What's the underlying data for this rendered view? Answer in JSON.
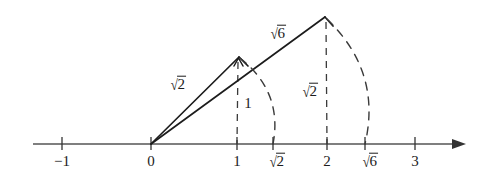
{
  "figure": {
    "background_color": "#ffffff",
    "ink_color": "#1c1c1c",
    "axis": {
      "name": "number-line",
      "y": 144,
      "x_start": 33,
      "x_end": 465,
      "arrow": "right",
      "tick_height": 9
    },
    "ticks": [
      {
        "label": "-1",
        "display": "−1",
        "kind": "plain",
        "x": 62
      },
      {
        "label": "0",
        "display": "0",
        "kind": "plain",
        "x": 151
      },
      {
        "label": "1",
        "display": "1",
        "kind": "plain",
        "x": 237
      },
      {
        "label": "sqrt2",
        "display": "2",
        "kind": "radical",
        "x": 273
      },
      {
        "label": "2",
        "display": "2",
        "kind": "plain",
        "x": 327
      },
      {
        "label": "sqrt6",
        "display": "6",
        "kind": "radical",
        "x": 365
      },
      {
        "label": "3",
        "display": "3",
        "kind": "plain",
        "x": 415
      }
    ],
    "segment_labels": [
      {
        "name": "hypotenuse-sqrt2-label",
        "display": "2",
        "kind": "radical",
        "x": 178,
        "y": 76
      },
      {
        "name": "hypotenuse-sqrt6-label",
        "display": "6",
        "kind": "radical",
        "x": 278,
        "y": 25
      },
      {
        "name": "leg-one-label",
        "display": "1",
        "kind": "plain",
        "x": 248,
        "y": 96
      },
      {
        "name": "leg-sqrt2-label",
        "display": "2",
        "kind": "radical",
        "x": 310,
        "y": 83
      }
    ],
    "construction": {
      "origin": {
        "x": 151,
        "y": 144
      },
      "small_triangle": {
        "name": "triangle-sqrt2",
        "apex": {
          "x": 239,
          "y": 57
        },
        "foot": {
          "x": 237,
          "y": 144
        },
        "hypotenuse_value": "sqrt2",
        "vertical_leg_value": "1"
      },
      "large_triangle": {
        "name": "triangle-sqrt6",
        "apex": {
          "x": 325,
          "y": 17
        },
        "foot": {
          "x": 327,
          "y": 144
        },
        "hypotenuse_value": "sqrt6",
        "vertical_leg_value": "sqrt2"
      },
      "arcs": [
        {
          "name": "arc-sqrt2",
          "from_x": 239,
          "from_y": 57,
          "to_x": 273,
          "to_y": 144
        },
        {
          "name": "arc-sqrt6",
          "from_x": 325,
          "from_y": 17,
          "to_x": 365,
          "to_y": 144
        }
      ]
    }
  }
}
